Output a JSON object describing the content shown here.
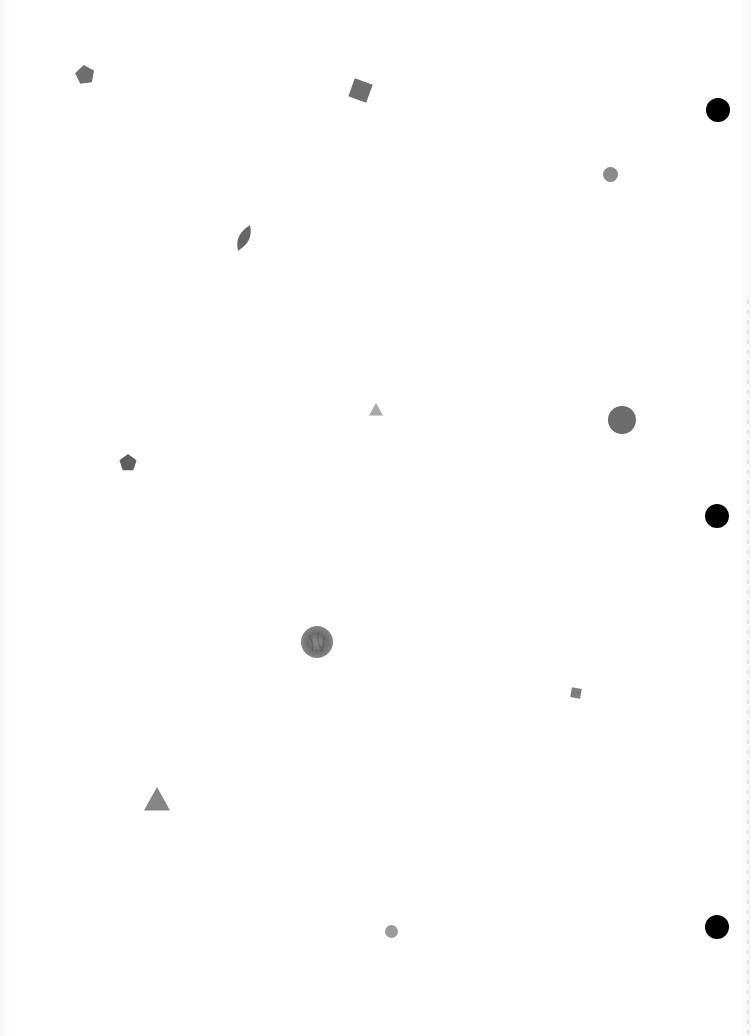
{
  "page": {
    "background": "#ffffff"
  },
  "shapes": [
    {
      "type": "pentagon",
      "cx": 85,
      "cy": 75,
      "size": 20,
      "rotation": -8,
      "color": "#6f6f6f"
    },
    {
      "type": "square",
      "cx": 360,
      "cy": 90,
      "size": 19,
      "rotation": 20,
      "color": "#6e6e6e"
    },
    {
      "type": "circle",
      "cx": 610,
      "cy": 174,
      "size": 15,
      "color": "#8a8a8a"
    },
    {
      "type": "leaf",
      "cx": 244,
      "cy": 238,
      "w": 16,
      "h": 28,
      "rotation": 25,
      "color": "#666666"
    },
    {
      "type": "triangle",
      "cx": 376,
      "cy": 410,
      "size": 14,
      "color": "#a8a8a8"
    },
    {
      "type": "circle",
      "cx": 622,
      "cy": 420,
      "size": 28,
      "color": "#6c6c6c"
    },
    {
      "type": "pentagon",
      "cx": 128,
      "cy": 463,
      "size": 18,
      "rotation": 0,
      "color": "#5e5e5e"
    },
    {
      "type": "textured-circle",
      "cx": 317,
      "cy": 642,
      "size": 32,
      "color": "#7a7a7a"
    },
    {
      "type": "square",
      "cx": 576,
      "cy": 693,
      "size": 10,
      "rotation": 10,
      "color": "#7d7d7d"
    },
    {
      "type": "triangle",
      "cx": 157,
      "cy": 800,
      "size": 26,
      "color": "#858585"
    },
    {
      "type": "circle",
      "cx": 391,
      "cy": 931,
      "size": 13,
      "color": "#9a9a9a"
    }
  ],
  "punch_holes": [
    {
      "cx": 718,
      "cy": 110,
      "size": 24,
      "color": "#000000"
    },
    {
      "cx": 717,
      "cy": 516,
      "size": 24,
      "color": "#000000"
    },
    {
      "cx": 717,
      "cy": 927,
      "size": 24,
      "color": "#000000"
    }
  ]
}
